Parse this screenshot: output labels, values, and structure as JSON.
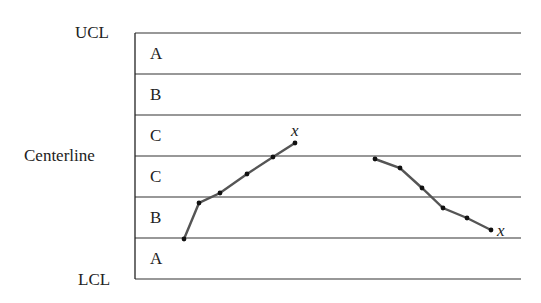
{
  "chart_data": {
    "type": "line",
    "title": "",
    "limit_labels": {
      "ucl": "UCL",
      "centerline": "Centerline",
      "lcl": "LCL"
    },
    "zones_top_to_bottom": [
      "A",
      "B",
      "C",
      "C",
      "B",
      "A"
    ],
    "series": [
      {
        "name": "increasing run",
        "end_marker": "x",
        "points": [
          [
            184,
            239
          ],
          [
            199,
            203
          ],
          [
            220,
            193
          ],
          [
            247,
            174
          ],
          [
            273,
            157
          ],
          [
            295,
            143
          ]
        ]
      },
      {
        "name": "decreasing run",
        "end_marker": "x",
        "points": [
          [
            375,
            159
          ],
          [
            400,
            168
          ],
          [
            422,
            188
          ],
          [
            443,
            208
          ],
          [
            467,
            218
          ],
          [
            491,
            230
          ]
        ]
      }
    ],
    "line_color": "#555555",
    "point_color": "#111111"
  }
}
